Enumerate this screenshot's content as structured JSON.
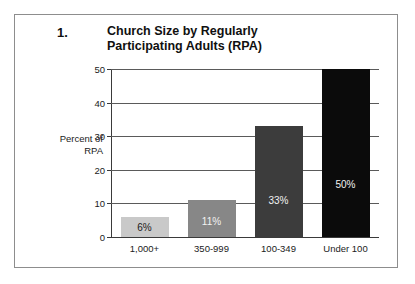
{
  "figure": {
    "number": "1.",
    "title_line1": "Church Size by Regularly",
    "title_line2": "Participating Adults (RPA)"
  },
  "axis": {
    "y_title_line1": "Percent of",
    "y_title_line2": "RPA"
  },
  "chart_data": {
    "type": "bar",
    "title": "Church Size by Regularly Participating Adults (RPA)",
    "xlabel": "",
    "ylabel": "Percent of RPA",
    "categories": [
      "1,000+",
      "350-999",
      "100-349",
      "Under 100"
    ],
    "values": [
      6,
      11,
      33,
      50
    ],
    "value_labels": [
      "6%",
      "11%",
      "33%",
      "50%"
    ],
    "bar_colors": [
      "#c9c9c9",
      "#878787",
      "#3c3c3c",
      "#0b0b0b"
    ],
    "bar_label_colors": [
      "#1b1b1b",
      "#f2f2f2",
      "#f2f2f2",
      "#f2f2f2"
    ],
    "ylim": [
      0,
      50
    ],
    "yticks": [
      0,
      10,
      20,
      30,
      40,
      50
    ],
    "ytick_labels": [
      "0",
      "10",
      "20",
      "30",
      "40",
      "50"
    ],
    "grid": true,
    "legend": "none"
  },
  "colors": {
    "frame": "#8d8d8d",
    "gridline": "#5a5a5a",
    "axis": "#3a3a3a",
    "text": "#101010",
    "background": "#ffffff"
  }
}
